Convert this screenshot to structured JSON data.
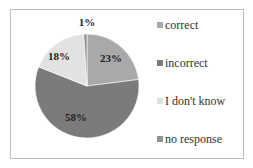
{
  "chart_data": {
    "type": "pie",
    "title": "",
    "categories": [
      "correct",
      "incorrect",
      "I don't know",
      "no response"
    ],
    "values": [
      23,
      58,
      18,
      1
    ],
    "labels": [
      "23%",
      "58%",
      "18%",
      "1%"
    ],
    "colors": [
      "#a9a9a9",
      "#7b7b7b",
      "#e2e2e2",
      "#939393"
    ],
    "start_angle": "12 o'clock",
    "direction": "clockwise",
    "legend_position": "right"
  },
  "legend": {
    "items": [
      {
        "label": "correct",
        "color": "#a9a9a9"
      },
      {
        "label": "incorrect",
        "color": "#7b7b7b"
      },
      {
        "label": "I don't know",
        "color": "#e2e2e2"
      },
      {
        "label": "no response",
        "color": "#939393"
      }
    ]
  }
}
